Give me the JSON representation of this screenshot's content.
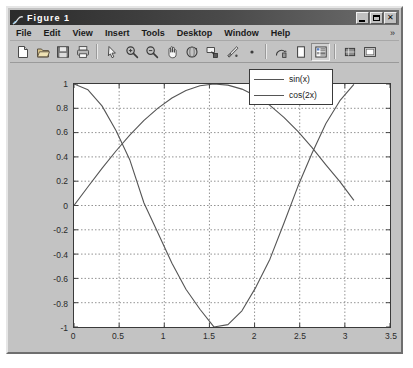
{
  "window": {
    "title": "Figure 1",
    "icon": "matlab-figure-icon",
    "buttons": [
      {
        "name": "minimize-button",
        "label": "_"
      },
      {
        "name": "maximize-button",
        "label": "□"
      },
      {
        "name": "close-button",
        "label": "×"
      }
    ]
  },
  "menubar": {
    "items": [
      {
        "label": "File"
      },
      {
        "label": "Edit"
      },
      {
        "label": "View"
      },
      {
        "label": "Insert"
      },
      {
        "label": "Tools"
      },
      {
        "label": "Desktop"
      },
      {
        "label": "Window"
      },
      {
        "label": "Help"
      }
    ],
    "overflow": "»"
  },
  "toolbar": {
    "buttons": [
      {
        "name": "new-figure-icon",
        "title": "New Figure"
      },
      {
        "name": "open-file-icon",
        "title": "Open File"
      },
      {
        "name": "save-figure-icon",
        "title": "Save Figure"
      },
      {
        "name": "print-figure-icon",
        "title": "Print Figure"
      },
      {
        "name": "edit-plot-arrow-icon",
        "title": "Edit Plot"
      },
      {
        "name": "zoom-in-icon",
        "title": "Zoom In"
      },
      {
        "name": "zoom-out-icon",
        "title": "Zoom Out"
      },
      {
        "name": "pan-hand-icon",
        "title": "Pan"
      },
      {
        "name": "rotate-3d-icon",
        "title": "Rotate 3D"
      },
      {
        "name": "data-cursor-icon",
        "title": "Data Cursor"
      },
      {
        "name": "brush-icon",
        "title": "Brush/Select Data"
      },
      {
        "name": "link-data-dot-icon",
        "title": "Link Plot"
      },
      {
        "name": "insert-colorbar-icon",
        "title": "Insert Colorbar"
      },
      {
        "name": "insert-legend-icon",
        "title": "Insert Legend"
      },
      {
        "name": "plot-browser-icon",
        "title": "Show Plot Tools"
      },
      {
        "name": "figure-palette-icon",
        "title": "Figure Palette"
      },
      {
        "name": "property-editor-icon",
        "title": "Property Editor"
      }
    ]
  },
  "chart_data": {
    "type": "line",
    "title": "",
    "xlabel": "",
    "ylabel": "",
    "xlim": [
      0,
      3.5
    ],
    "ylim": [
      -1,
      1
    ],
    "grid": true,
    "legend_position": "upper right",
    "xticks": [
      "0",
      "0.5",
      "1",
      "1.5",
      "2",
      "2.5",
      "3",
      "3.5"
    ],
    "xtick_values": [
      0,
      0.5,
      1,
      1.5,
      2,
      2.5,
      3,
      3.5
    ],
    "yticks": [
      "1",
      "0.8",
      "0.6",
      "0.4",
      "0.2",
      "0",
      "-0.2",
      "-0.4",
      "-0.6",
      "-0.8",
      "-1"
    ],
    "ytick_values": [
      1,
      0.8,
      0.6,
      0.4,
      0.2,
      0,
      -0.2,
      -0.4,
      -0.6,
      -0.8,
      -1
    ],
    "x_domain": [
      0,
      3.1
    ],
    "series": [
      {
        "name": "sin(x)",
        "color": "#555555",
        "expression": "sin(x)",
        "x": [
          0,
          0.155,
          0.31,
          0.465,
          0.62,
          0.775,
          0.93,
          1.085,
          1.24,
          1.395,
          1.55,
          1.705,
          1.86,
          2.015,
          2.17,
          2.325,
          2.48,
          2.635,
          2.79,
          2.945,
          3.1
        ],
        "values": [
          0,
          0.1544,
          0.3051,
          0.4485,
          0.581,
          0.6999,
          0.8016,
          0.8846,
          0.9458,
          0.9851,
          0.9998,
          0.9906,
          0.958,
          0.9022,
          0.8243,
          0.7259,
          0.6096,
          0.4784,
          0.335,
          0.1965,
          0.0416
        ]
      },
      {
        "name": "cos(2x)",
        "color": "#555555",
        "expression": "cos(2x)",
        "x": [
          0,
          0.155,
          0.31,
          0.465,
          0.62,
          0.775,
          0.93,
          1.085,
          1.24,
          1.395,
          1.55,
          1.705,
          1.86,
          2.015,
          2.17,
          2.325,
          2.48,
          2.635,
          2.79,
          2.945,
          3.1
        ],
        "values": [
          1,
          0.9523,
          0.8198,
          0.6178,
          0.3717,
          0.0203,
          -0.2272,
          -0.475,
          -0.6894,
          -0.854,
          -0.9996,
          -0.9804,
          -0.8665,
          -0.6716,
          -0.4416,
          -0.146,
          0.1579,
          0.4281,
          0.6749,
          0.8628,
          0.9966
        ]
      }
    ]
  }
}
